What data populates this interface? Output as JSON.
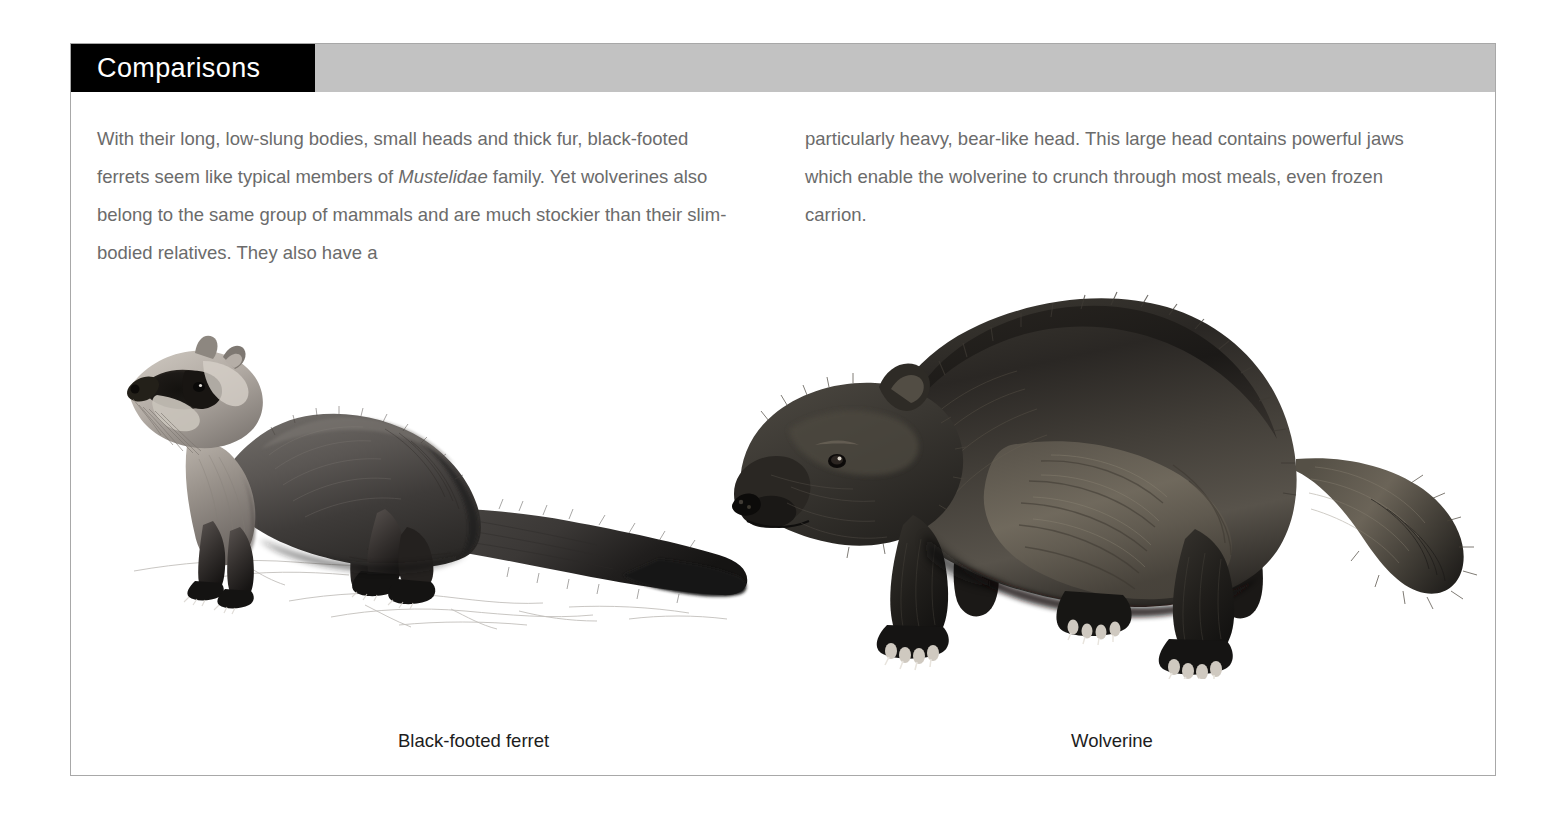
{
  "page": {
    "section_title": "Comparisons"
  },
  "body": {
    "left_column": {
      "paragraph_part1": "With their long, low-slung bodies, small heads and thick fur, black-footed ferrets seem like typical members of ",
      "italic_term": "Mustelidae",
      "paragraph_part2": " family. Yet wolverines also belong to the same group of mammals and are much stockier than their slim-bodied relatives. They also have a"
    },
    "right_column": {
      "paragraph": "particularly heavy, bear-like head. This large head contains powerful jaws which enable the wolverine to crunch through most meals, even frozen carrion."
    }
  },
  "figures": {
    "ferret": {
      "caption": "Black-footed ferret",
      "illustration_name": "black-footed-ferret-illustration"
    },
    "wolverine": {
      "caption": "Wolverine",
      "illustration_name": "wolverine-illustration"
    }
  },
  "colors": {
    "title_block": "#000000",
    "title_text": "#ffffff",
    "header_gray": "#c2c2c2",
    "body_text": "#6b6b6b",
    "caption_text": "#1d1d1d",
    "page_border": "#a8a8a8",
    "background": "#ffffff"
  }
}
